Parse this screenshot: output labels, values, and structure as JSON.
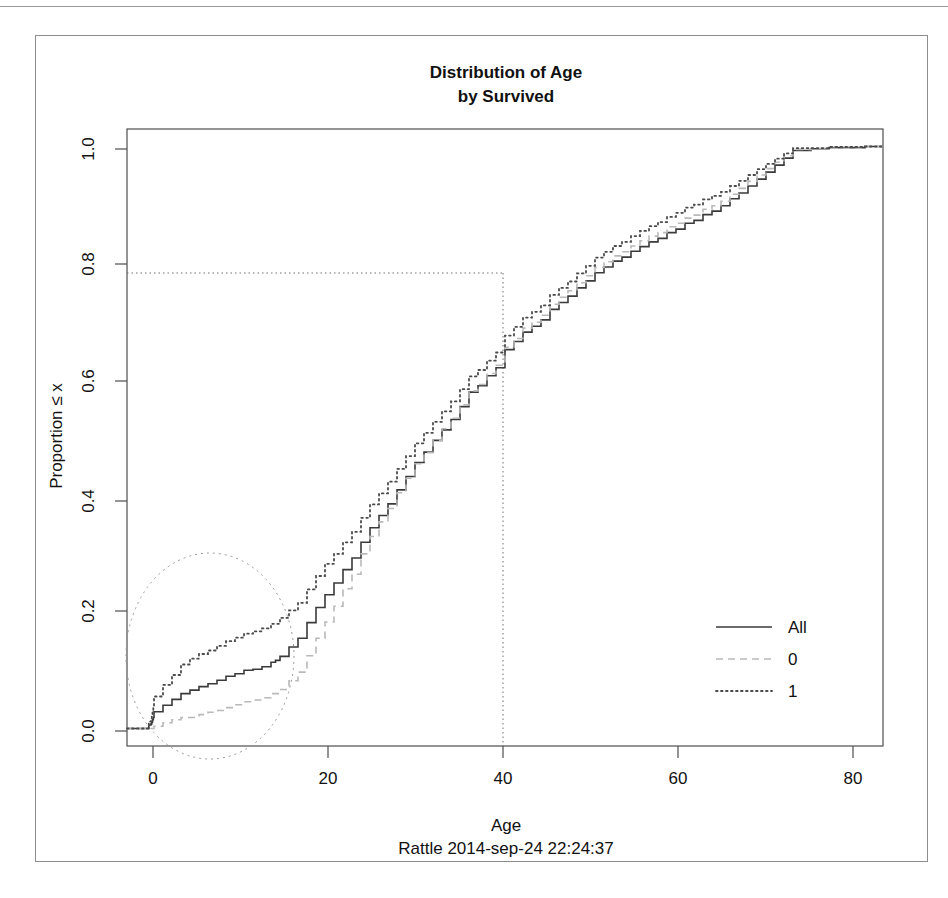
{
  "chart_data": {
    "type": "line",
    "subtype": "ecdf-step",
    "title": "Distribution of Age",
    "subtitle": "by Survived",
    "caption": "Rattle 2014-sep-24 22:24:37",
    "xlabel": "Age",
    "ylabel": "Proportion ≤ x",
    "xlim": [
      -2,
      82
    ],
    "ylim": [
      -0.03,
      1.03
    ],
    "xticks": [
      0,
      20,
      40,
      60,
      80
    ],
    "xtick_labels": [
      "0",
      "20",
      "40",
      "60",
      "80"
    ],
    "yticks": [
      0.0,
      0.2,
      0.4,
      0.6,
      0.8,
      1.0
    ],
    "ytick_labels": [
      "0.0",
      "0.2",
      "0.4",
      "0.6",
      "0.8",
      "1.0"
    ],
    "grid": false,
    "legend_position": "right-middle",
    "legend": [
      {
        "label": "All",
        "style": "solid",
        "color": "#3a3a3a"
      },
      {
        "label": "0",
        "style": "dashed",
        "color": "#b9b9b9"
      },
      {
        "label": "1",
        "style": "dotted",
        "color": "#4a4a4a"
      }
    ],
    "annotations": [
      {
        "name": "reference-crosshair",
        "kind": "crosshair",
        "style": "dotted",
        "x": 40,
        "y": 0.785,
        "description": "dotted vertical line at Age = 40 meeting dotted horizontal line at Proportion = 0.785"
      },
      {
        "name": "highlight-ellipse",
        "kind": "ellipse",
        "style": "dotted",
        "center_x": 9.5,
        "center_y": 0.125,
        "radius_x": 9.6,
        "radius_y": 0.175,
        "description": "dotted ellipse highlighting the low-age region where the three curves separate"
      }
    ],
    "series": [
      {
        "name": "All",
        "style": "solid",
        "color": "#3a3a3a",
        "points": [
          [
            0.42,
            0.006
          ],
          [
            0.67,
            0.008
          ],
          [
            0.75,
            0.011
          ],
          [
            0.83,
            0.015
          ],
          [
            0.92,
            0.019
          ],
          [
            1.0,
            0.029
          ],
          [
            2.0,
            0.04
          ],
          [
            3.0,
            0.05
          ],
          [
            4.0,
            0.06
          ],
          [
            5.0,
            0.066
          ],
          [
            6.0,
            0.072
          ],
          [
            7.0,
            0.077
          ],
          [
            8.0,
            0.083
          ],
          [
            9.0,
            0.09
          ],
          [
            10.0,
            0.094
          ],
          [
            11.0,
            0.1
          ],
          [
            12.0,
            0.102
          ],
          [
            13.0,
            0.106
          ],
          [
            14.0,
            0.114
          ],
          [
            14.5,
            0.117
          ],
          [
            15.0,
            0.124
          ],
          [
            16.0,
            0.14
          ],
          [
            17.0,
            0.155
          ],
          [
            18.0,
            0.182
          ],
          [
            19.0,
            0.208
          ],
          [
            20.0,
            0.23
          ],
          [
            21.0,
            0.25
          ],
          [
            22.0,
            0.273
          ],
          [
            23.0,
            0.293
          ],
          [
            24.0,
            0.32
          ],
          [
            25.0,
            0.345
          ],
          [
            26.0,
            0.366
          ],
          [
            27.0,
            0.386
          ],
          [
            28.0,
            0.41
          ],
          [
            29.0,
            0.433
          ],
          [
            30.0,
            0.457
          ],
          [
            31.0,
            0.475
          ],
          [
            32.0,
            0.495
          ],
          [
            33.0,
            0.513
          ],
          [
            34.0,
            0.531
          ],
          [
            35.0,
            0.553
          ],
          [
            36.0,
            0.578
          ],
          [
            37.0,
            0.589
          ],
          [
            38.0,
            0.606
          ],
          [
            39.0,
            0.62
          ],
          [
            40.0,
            0.651
          ],
          [
            41.0,
            0.665
          ],
          [
            42.0,
            0.681
          ],
          [
            43.0,
            0.691
          ],
          [
            44.0,
            0.702
          ],
          [
            45.0,
            0.72
          ],
          [
            46.0,
            0.732
          ],
          [
            47.0,
            0.743
          ],
          [
            48.0,
            0.757
          ],
          [
            49.0,
            0.769
          ],
          [
            50.0,
            0.783
          ],
          [
            51.0,
            0.793
          ],
          [
            52.0,
            0.803
          ],
          [
            53.0,
            0.81
          ],
          [
            54.0,
            0.82
          ],
          [
            55.0,
            0.828
          ],
          [
            56.0,
            0.836
          ],
          [
            57.0,
            0.842
          ],
          [
            58.0,
            0.852
          ],
          [
            59.0,
            0.858
          ],
          [
            60.0,
            0.868
          ],
          [
            61.0,
            0.873
          ],
          [
            62.0,
            0.883
          ],
          [
            63.0,
            0.889
          ],
          [
            64.0,
            0.898
          ],
          [
            65.0,
            0.91
          ],
          [
            66.0,
            0.92
          ],
          [
            67.0,
            0.932
          ],
          [
            68.0,
            0.944
          ],
          [
            69.0,
            0.956
          ],
          [
            70.0,
            0.968
          ],
          [
            71.0,
            0.98
          ],
          [
            72.0,
            0.993
          ],
          [
            74.0,
            0.996
          ],
          [
            76.0,
            0.998
          ],
          [
            80.0,
            1.0
          ]
        ]
      },
      {
        "name": "0",
        "style": "dashed",
        "color": "#b9b9b9",
        "points": [
          [
            1.0,
            0.004
          ],
          [
            2.0,
            0.01
          ],
          [
            3.0,
            0.015
          ],
          [
            4.0,
            0.019
          ],
          [
            6.0,
            0.024
          ],
          [
            7.0,
            0.028
          ],
          [
            8.0,
            0.031
          ],
          [
            9.0,
            0.036
          ],
          [
            10.0,
            0.041
          ],
          [
            11.0,
            0.046
          ],
          [
            12.0,
            0.049
          ],
          [
            13.0,
            0.053
          ],
          [
            14.0,
            0.06
          ],
          [
            15.0,
            0.067
          ],
          [
            16.0,
            0.082
          ],
          [
            17.0,
            0.097
          ],
          [
            18.0,
            0.125
          ],
          [
            19.0,
            0.155
          ],
          [
            20.0,
            0.183
          ],
          [
            21.0,
            0.21
          ],
          [
            22.0,
            0.24
          ],
          [
            23.0,
            0.265
          ],
          [
            24.0,
            0.3
          ],
          [
            25.0,
            0.33
          ],
          [
            26.0,
            0.355
          ],
          [
            27.0,
            0.378
          ],
          [
            28.0,
            0.405
          ],
          [
            29.0,
            0.43
          ],
          [
            30.0,
            0.455
          ],
          [
            31.0,
            0.474
          ],
          [
            32.0,
            0.495
          ],
          [
            33.0,
            0.515
          ],
          [
            34.0,
            0.533
          ],
          [
            35.0,
            0.556
          ],
          [
            36.0,
            0.58
          ],
          [
            37.0,
            0.591
          ],
          [
            38.0,
            0.61
          ],
          [
            39.0,
            0.624
          ],
          [
            40.0,
            0.655
          ],
          [
            41.0,
            0.67
          ],
          [
            42.0,
            0.688
          ],
          [
            43.0,
            0.698
          ],
          [
            44.0,
            0.71
          ],
          [
            45.0,
            0.729
          ],
          [
            46.0,
            0.741
          ],
          [
            47.0,
            0.752
          ],
          [
            48.0,
            0.766
          ],
          [
            49.0,
            0.778
          ],
          [
            50.0,
            0.792
          ],
          [
            51.0,
            0.802
          ],
          [
            52.0,
            0.812
          ],
          [
            53.0,
            0.819
          ],
          [
            54.0,
            0.829
          ],
          [
            55.0,
            0.838
          ],
          [
            56.0,
            0.846
          ],
          [
            57.0,
            0.852
          ],
          [
            58.0,
            0.862
          ],
          [
            59.0,
            0.868
          ],
          [
            60.0,
            0.877
          ],
          [
            61.0,
            0.882
          ],
          [
            62.0,
            0.892
          ],
          [
            63.0,
            0.898
          ],
          [
            64.0,
            0.906
          ],
          [
            65.0,
            0.918
          ],
          [
            66.0,
            0.928
          ],
          [
            67.0,
            0.94
          ],
          [
            68.0,
            0.951
          ],
          [
            69.0,
            0.962
          ],
          [
            70.0,
            0.973
          ],
          [
            71.0,
            0.984
          ],
          [
            72.0,
            0.995
          ],
          [
            74.0,
            0.997
          ],
          [
            80.0,
            1.0
          ]
        ]
      },
      {
        "name": "1",
        "style": "dotted",
        "color": "#4a4a4a",
        "points": [
          [
            0.42,
            0.012
          ],
          [
            0.67,
            0.018
          ],
          [
            0.75,
            0.024
          ],
          [
            0.83,
            0.031
          ],
          [
            0.92,
            0.038
          ],
          [
            1.0,
            0.055
          ],
          [
            2.0,
            0.075
          ],
          [
            3.0,
            0.092
          ],
          [
            4.0,
            0.11
          ],
          [
            5.0,
            0.12
          ],
          [
            6.0,
            0.128
          ],
          [
            7.0,
            0.134
          ],
          [
            8.0,
            0.142
          ],
          [
            9.0,
            0.15
          ],
          [
            10.0,
            0.156
          ],
          [
            11.0,
            0.163
          ],
          [
            12.0,
            0.167
          ],
          [
            13.0,
            0.172
          ],
          [
            14.0,
            0.18
          ],
          [
            15.0,
            0.19
          ],
          [
            16.0,
            0.203
          ],
          [
            17.0,
            0.216
          ],
          [
            18.0,
            0.239
          ],
          [
            19.0,
            0.262
          ],
          [
            20.0,
            0.283
          ],
          [
            21.0,
            0.3
          ],
          [
            22.0,
            0.32
          ],
          [
            23.0,
            0.338
          ],
          [
            24.0,
            0.362
          ],
          [
            25.0,
            0.385
          ],
          [
            26.0,
            0.404
          ],
          [
            27.0,
            0.424
          ],
          [
            28.0,
            0.446
          ],
          [
            29.0,
            0.468
          ],
          [
            30.0,
            0.49
          ],
          [
            31.0,
            0.508
          ],
          [
            32.0,
            0.527
          ],
          [
            33.0,
            0.545
          ],
          [
            34.0,
            0.562
          ],
          [
            35.0,
            0.583
          ],
          [
            36.0,
            0.605
          ],
          [
            37.0,
            0.616
          ],
          [
            38.0,
            0.632
          ],
          [
            39.0,
            0.646
          ],
          [
            40.0,
            0.675
          ],
          [
            41.0,
            0.69
          ],
          [
            42.0,
            0.706
          ],
          [
            43.0,
            0.716
          ],
          [
            44.0,
            0.727
          ],
          [
            45.0,
            0.745
          ],
          [
            46.0,
            0.757
          ],
          [
            47.0,
            0.768
          ],
          [
            48.0,
            0.782
          ],
          [
            49.0,
            0.795
          ],
          [
            50.0,
            0.809
          ],
          [
            51.0,
            0.819
          ],
          [
            52.0,
            0.829
          ],
          [
            53.0,
            0.836
          ],
          [
            54.0,
            0.846
          ],
          [
            55.0,
            0.855
          ],
          [
            56.0,
            0.863
          ],
          [
            57.0,
            0.87
          ],
          [
            58.0,
            0.879
          ],
          [
            59.0,
            0.886
          ],
          [
            60.0,
            0.895
          ],
          [
            61.0,
            0.9
          ],
          [
            62.0,
            0.909
          ],
          [
            63.0,
            0.915
          ],
          [
            64.0,
            0.922
          ],
          [
            65.0,
            0.932
          ],
          [
            66.0,
            0.941
          ],
          [
            67.0,
            0.951
          ],
          [
            68.0,
            0.961
          ],
          [
            69.0,
            0.97
          ],
          [
            70.0,
            0.979
          ],
          [
            71.0,
            0.988
          ],
          [
            72.0,
            0.997
          ],
          [
            76.0,
            0.999
          ],
          [
            80.0,
            1.0
          ]
        ]
      }
    ]
  },
  "colors": {
    "axis": "#4d4d4d",
    "text": "#111111",
    "annotation": "#8f8f8f",
    "frame": "#8d8d8d"
  }
}
